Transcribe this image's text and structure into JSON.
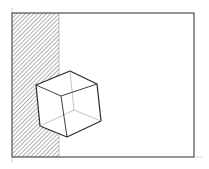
{
  "sketch": {
    "description": "Hand-drawn pencil sketch: rectangular frame with a hatched left strip and a wireframe cube overlapping the strip edge",
    "colors": {
      "background": "#ffffff",
      "stroke": "#2a2a2a",
      "hatch": "#555555",
      "hidden_edge": "#9a9a9a"
    },
    "frame": {
      "x": 12,
      "y": 13,
      "width": 182,
      "height": 144
    },
    "hatched_region": {
      "x": 12,
      "y": 13,
      "width": 47,
      "height": 144
    },
    "cube": {
      "outer_outline": [
        [
          70,
          71
        ],
        [
          97,
          84
        ],
        [
          101,
          121
        ],
        [
          67,
          137
        ],
        [
          40,
          126
        ],
        [
          36,
          85
        ]
      ],
      "front_edges": [
        [
          [
            36,
            85
          ],
          [
            61,
            96
          ]
        ],
        [
          [
            61,
            96
          ],
          [
            97,
            84
          ]
        ],
        [
          [
            61,
            96
          ],
          [
            67,
            137
          ]
        ]
      ],
      "hidden_vertex": [
        74,
        110
      ],
      "hidden_edges": [
        [
          [
            74,
            110
          ],
          [
            70,
            71
          ]
        ],
        [
          [
            74,
            110
          ],
          [
            40,
            126
          ]
        ],
        [
          [
            74,
            110
          ],
          [
            101,
            121
          ]
        ]
      ]
    }
  }
}
